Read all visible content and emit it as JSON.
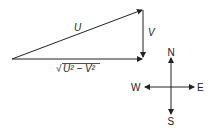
{
  "diagram": {
    "vectors": {
      "resultant_label": "U",
      "vertical_label": "V",
      "base_label_radicand": "U² − V²",
      "base_label_root": "√"
    },
    "compass": {
      "north": "N",
      "south": "S",
      "east": "E",
      "west": "W"
    },
    "colors": {
      "stroke": "#222222",
      "background": "#ffffff"
    }
  }
}
